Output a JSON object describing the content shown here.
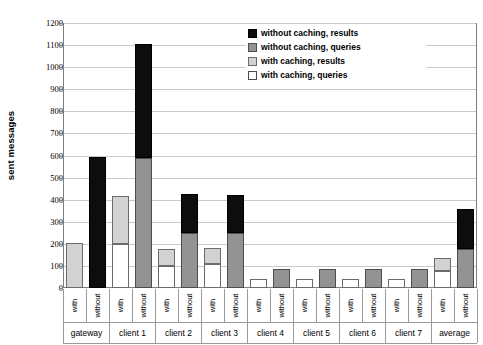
{
  "chart_data": {
    "type": "bar",
    "title": "",
    "xlabel": "",
    "ylabel": "sent messages",
    "ylim": [
      0,
      1200
    ],
    "ytick_step": 100,
    "yticks": [
      0,
      100,
      200,
      300,
      400,
      500,
      600,
      700,
      800,
      900,
      1000,
      1100,
      1200
    ],
    "ytick_labels": [
      "0",
      "100",
      "200",
      "300",
      "400",
      "500",
      "600",
      "700",
      "800",
      "900",
      "1000",
      "1100",
      "1200"
    ],
    "grid": true,
    "stacked": true,
    "legend_position": "top-right",
    "legend": [
      {
        "key": "results_without",
        "label": "without caching, results",
        "color": "#0d0d0d"
      },
      {
        "key": "queries_without",
        "label": "without caching, queries",
        "color": "#939393"
      },
      {
        "key": "results_with",
        "label": "with caching, results",
        "color": "#d2d2d2"
      },
      {
        "key": "queries_with",
        "label": "with caching, queries",
        "color": "#ffffff"
      }
    ],
    "categories": [
      "gateway",
      "client 1",
      "client 2",
      "client 3",
      "client 4",
      "client 5",
      "client 6",
      "client 7",
      "average"
    ],
    "subcategories": [
      "with",
      "without"
    ],
    "groups": [
      {
        "name": "gateway",
        "bars": [
          {
            "sub": "with",
            "queries": 0,
            "results": 205,
            "total": 205,
            "queries_class": "queries-c",
            "results_class": "results-c"
          },
          {
            "sub": "without",
            "queries": 0,
            "results": 595,
            "total": 595,
            "queries_class": "queries-nc",
            "results_class": "results-nc"
          }
        ]
      },
      {
        "name": "client 1",
        "bars": [
          {
            "sub": "with",
            "queries": 200,
            "results": 215,
            "total": 415,
            "queries_class": "queries-c",
            "results_class": "results-c"
          },
          {
            "sub": "without",
            "queries": 590,
            "results": 515,
            "total": 1105,
            "queries_class": "queries-nc",
            "results_class": "results-nc"
          }
        ]
      },
      {
        "name": "client 2",
        "bars": [
          {
            "sub": "with",
            "queries": 100,
            "results": 75,
            "total": 175,
            "queries_class": "queries-c",
            "results_class": "results-c"
          },
          {
            "sub": "without",
            "queries": 250,
            "results": 175,
            "total": 425,
            "queries_class": "queries-nc",
            "results_class": "results-nc"
          }
        ]
      },
      {
        "name": "client 3",
        "bars": [
          {
            "sub": "with",
            "queries": 110,
            "results": 70,
            "total": 180,
            "queries_class": "queries-c",
            "results_class": "results-c"
          },
          {
            "sub": "without",
            "queries": 250,
            "results": 170,
            "total": 420,
            "queries_class": "queries-nc",
            "results_class": "results-nc"
          }
        ]
      },
      {
        "name": "client 4",
        "bars": [
          {
            "sub": "with",
            "queries": 40,
            "results": 0,
            "total": 40,
            "queries_class": "queries-c",
            "results_class": "results-c"
          },
          {
            "sub": "without",
            "queries": 85,
            "results": 0,
            "total": 85,
            "queries_class": "queries-nc",
            "results_class": "results-nc"
          }
        ]
      },
      {
        "name": "client 5",
        "bars": [
          {
            "sub": "with",
            "queries": 40,
            "results": 0,
            "total": 40,
            "queries_class": "queries-c",
            "results_class": "results-c"
          },
          {
            "sub": "without",
            "queries": 85,
            "results": 0,
            "total": 85,
            "queries_class": "queries-nc",
            "results_class": "results-nc"
          }
        ]
      },
      {
        "name": "client 6",
        "bars": [
          {
            "sub": "with",
            "queries": 40,
            "results": 0,
            "total": 40,
            "queries_class": "queries-c",
            "results_class": "results-c"
          },
          {
            "sub": "without",
            "queries": 85,
            "results": 0,
            "total": 85,
            "queries_class": "queries-nc",
            "results_class": "results-nc"
          }
        ]
      },
      {
        "name": "client 7",
        "bars": [
          {
            "sub": "with",
            "queries": 40,
            "results": 0,
            "total": 40,
            "queries_class": "queries-c",
            "results_class": "results-c"
          },
          {
            "sub": "without",
            "queries": 85,
            "results": 0,
            "total": 85,
            "queries_class": "queries-nc",
            "results_class": "results-nc"
          }
        ]
      },
      {
        "name": "average",
        "bars": [
          {
            "sub": "with",
            "queries": 75,
            "results": 60,
            "total": 135,
            "queries_class": "queries-c",
            "results_class": "results-c"
          },
          {
            "sub": "without",
            "queries": 175,
            "results": 185,
            "total": 360,
            "queries_class": "queries-nc",
            "results_class": "results-nc"
          }
        ]
      }
    ]
  }
}
